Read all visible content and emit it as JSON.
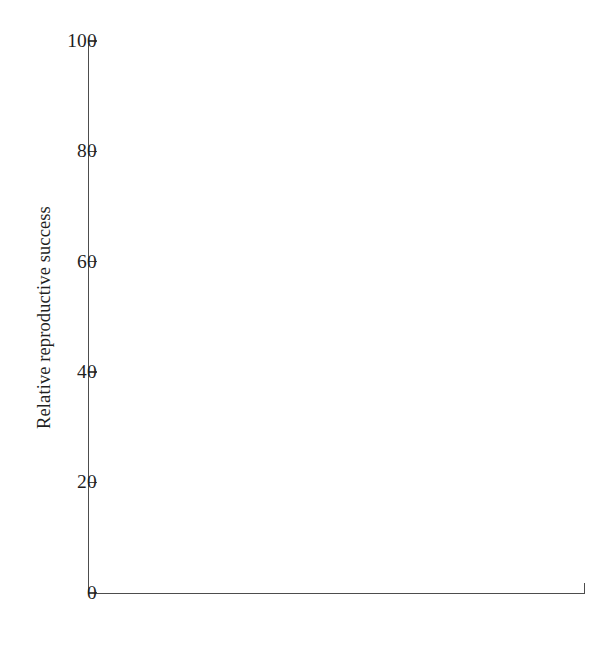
{
  "chart_data": {
    "type": "bar",
    "title": "",
    "subtitle": "",
    "xlabel": "",
    "ylabel": "Relative reproductive success",
    "categories": [
      "Enclosures",
      "Laboratory"
    ],
    "series": [
      {
        "name": "Inbred",
        "values": [
          22.0,
          39.3
        ],
        "fill": "#ffffff",
        "stroke": "#555555"
      },
      {
        "name": "Outbred",
        "values": [
          78.0,
          61.6
        ],
        "fill": "#0b0b0b",
        "stroke": "#0b0b0b"
      }
    ],
    "ylim": [
      0,
      100
    ],
    "ytick_labels": [
      "0",
      "20",
      "40",
      "60",
      "80",
      "100"
    ],
    "ytick_values": [
      0,
      20,
      40,
      60,
      80,
      100
    ],
    "grid": false,
    "legend_position": "top-right",
    "legend_entries": [
      {
        "label": "Inbred",
        "swatch": "open-square"
      },
      {
        "label": "Outbred",
        "swatch": "filled-square"
      }
    ]
  },
  "axes": {
    "y_title": "Relative reproductive success",
    "ticks": [
      {
        "label": "100"
      },
      {
        "label": "80"
      },
      {
        "label": "60"
      },
      {
        "label": "40"
      },
      {
        "label": "20"
      },
      {
        "label": "0"
      }
    ]
  },
  "categories": [
    {
      "label": "Enclosures"
    },
    {
      "label": "Laboratory"
    }
  ],
  "legend": {
    "items": [
      {
        "label": "Inbred"
      },
      {
        "label": "Outbred"
      }
    ]
  }
}
